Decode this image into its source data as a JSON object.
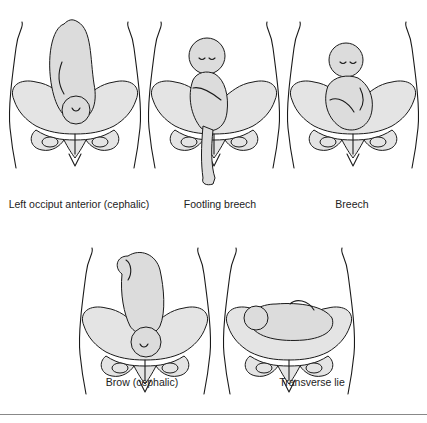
{
  "figure": {
    "panels": [
      {
        "id": "loa",
        "label": "Left occiput anterior (cephalic)",
        "presentation": "cephalic",
        "orientation": "head-down"
      },
      {
        "id": "footling",
        "label": "Footling breech",
        "presentation": "breech",
        "orientation": "head-up, one leg extended below"
      },
      {
        "id": "breech",
        "label": "Breech",
        "presentation": "breech",
        "orientation": "head-up, legs flexed"
      },
      {
        "id": "brow",
        "label": "Brow (cephalic)",
        "presentation": "cephalic",
        "orientation": "head-down, brow first"
      },
      {
        "id": "transverse",
        "label": "Transverse lie",
        "presentation": "transverse",
        "orientation": "horizontal"
      }
    ],
    "colors": {
      "line": "#1a1a1a",
      "fill": "#dcdcdc",
      "background": "#ffffff"
    }
  }
}
